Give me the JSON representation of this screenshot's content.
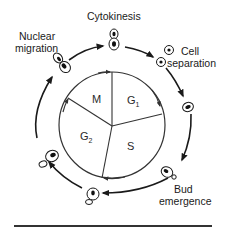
{
  "diagram": {
    "inner_cycle": {
      "phases": [
        {
          "id": "M",
          "label": "M",
          "subscript": ""
        },
        {
          "id": "G1",
          "label": "G",
          "subscript": "1"
        },
        {
          "id": "S",
          "label": "S",
          "subscript": ""
        },
        {
          "id": "G2",
          "label": "G",
          "subscript": "2"
        }
      ],
      "direction": "clockwise"
    },
    "outer_events": [
      {
        "id": "cytokinesis",
        "lines": [
          "Cytokinesis"
        ]
      },
      {
        "id": "cell-separation",
        "lines": [
          "Cell",
          "separation"
        ]
      },
      {
        "id": "bud-emergence",
        "lines": [
          "Bud",
          "emergence"
        ]
      },
      {
        "id": "nuclear-migration",
        "lines": [
          "Nuclear",
          "migration"
        ]
      }
    ],
    "colors": {
      "line": "#1a1a1a",
      "background": "#ffffff"
    }
  }
}
